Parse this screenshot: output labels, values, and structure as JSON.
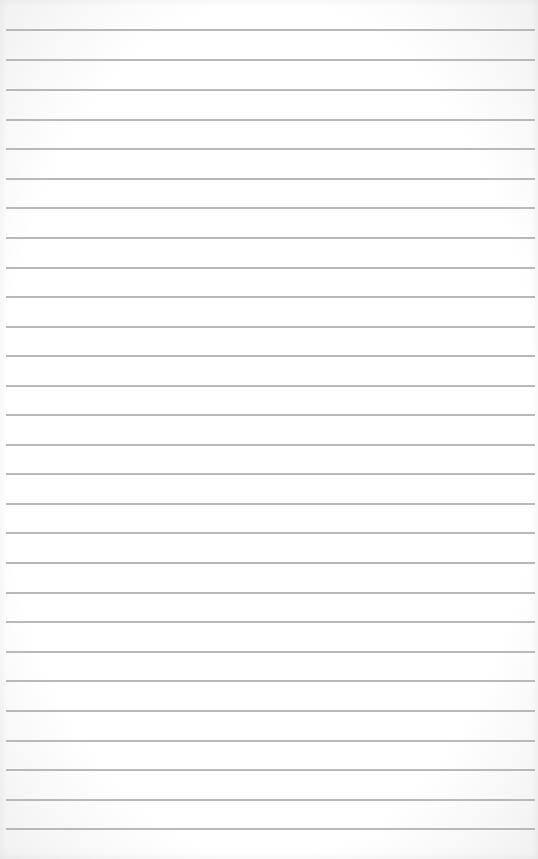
{
  "page": {
    "type": "lined-paper",
    "background_color": "#ffffff",
    "rule_color": "#b9b9b9",
    "rule_count": 28,
    "rule_positions_y": [
      29,
      59,
      89,
      119,
      148,
      178,
      207,
      237,
      267,
      296,
      326,
      355,
      385,
      414,
      444,
      473,
      503,
      532,
      562,
      592,
      621,
      651,
      680,
      710,
      740,
      769,
      799,
      828
    ],
    "text": ""
  }
}
